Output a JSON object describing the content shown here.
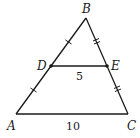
{
  "diagram": {
    "colors": {
      "stroke": "#1a1a1a",
      "background": "#ffffff"
    },
    "points": {
      "A": {
        "label": "A",
        "x": 16,
        "y": 114
      },
      "B": {
        "label": "B",
        "x": 86,
        "y": 18
      },
      "C": {
        "label": "C",
        "x": 128,
        "y": 114
      },
      "D": {
        "label": "D",
        "x": 51,
        "y": 66
      },
      "E": {
        "label": "E",
        "x": 107,
        "y": 66
      }
    },
    "segments": [
      {
        "from": "A",
        "to": "B"
      },
      {
        "from": "B",
        "to": "C"
      },
      {
        "from": "A",
        "to": "C",
        "length_label": "10"
      },
      {
        "from": "D",
        "to": "E",
        "length_label": "5"
      }
    ],
    "tick_marks": [
      {
        "segment": "BD",
        "count": 1
      },
      {
        "segment": "DA",
        "count": 1
      },
      {
        "segment": "BE",
        "count": 2
      },
      {
        "segment": "EC",
        "count": 2
      }
    ],
    "labels": {
      "A": "A",
      "B": "B",
      "C": "C",
      "D": "D",
      "E": "E",
      "DE_length": "5",
      "AC_length": "10"
    }
  }
}
